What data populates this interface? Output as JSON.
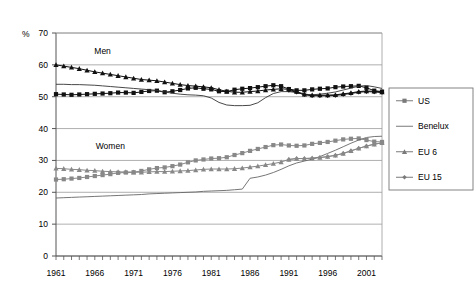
{
  "chart_data": {
    "type": "line",
    "title": "",
    "xlabel": "",
    "ylabel": "%",
    "ylim": [
      0,
      70
    ],
    "xlim": [
      1961,
      2003
    ],
    "ytick_labels": [
      "0",
      "10",
      "20",
      "30",
      "40",
      "50",
      "60",
      "70"
    ],
    "ytick_values": [
      0,
      10,
      20,
      30,
      40,
      50,
      60,
      70
    ],
    "xtick_labels": [
      "1961",
      "1966",
      "1971",
      "1976",
      "1981",
      "1986",
      "1991",
      "1996",
      "2001"
    ],
    "xtick_values": [
      1961,
      1966,
      1971,
      1976,
      1981,
      1986,
      1991,
      1996,
      2001
    ],
    "grid": "horizontal",
    "legend_position": "right",
    "annotations": [
      {
        "text": "Men",
        "x": 1967,
        "y": 63.5
      },
      {
        "text": "Women",
        "x": 1968,
        "y": 33.5
      }
    ],
    "legend": [
      {
        "name": "US",
        "marker": "square",
        "color": "#111111"
      },
      {
        "name": "Benelux",
        "marker": "none",
        "color": "#333333"
      },
      {
        "name": "EU 6",
        "marker": "triangle",
        "color": "#111111"
      },
      {
        "name": "EU 15",
        "marker": "diamond",
        "color": "#111111"
      }
    ],
    "x": [
      1961,
      1962,
      1963,
      1964,
      1965,
      1966,
      1967,
      1968,
      1969,
      1970,
      1971,
      1972,
      1973,
      1974,
      1975,
      1976,
      1977,
      1978,
      1979,
      1980,
      1981,
      1982,
      1983,
      1984,
      1985,
      1986,
      1987,
      1988,
      1989,
      1990,
      1991,
      1992,
      1993,
      1994,
      1995,
      1996,
      1997,
      1998,
      1999,
      2000,
      2001,
      2002,
      2003
    ],
    "series": [
      {
        "name": "Men EU 6",
        "group": "Men",
        "key": "EU 6",
        "marker": "triangle",
        "color": "#111111",
        "values": [
          60.0,
          59.6,
          59.2,
          58.8,
          58.3,
          57.8,
          57.4,
          57.0,
          56.6,
          56.2,
          55.8,
          55.4,
          55.2,
          55.0,
          54.6,
          54.2,
          53.8,
          53.5,
          53.3,
          53.1,
          52.8,
          52.2,
          51.7,
          51.4,
          51.4,
          51.6,
          51.8,
          52.1,
          52.3,
          52.5,
          52.3,
          51.6,
          50.8,
          50.5,
          50.5,
          50.5,
          50.6,
          50.9,
          51.2,
          51.6,
          51.8,
          51.7,
          51.5
        ]
      },
      {
        "name": "Men US",
        "group": "Men",
        "key": "US",
        "marker": "square",
        "color": "#111111",
        "values": [
          50.8,
          50.7,
          50.6,
          50.7,
          50.8,
          50.9,
          51.0,
          51.1,
          51.3,
          51.3,
          51.2,
          51.5,
          51.8,
          51.9,
          51.4,
          51.7,
          52.1,
          52.6,
          52.8,
          52.5,
          52.3,
          51.7,
          51.6,
          52.2,
          52.5,
          52.7,
          53.0,
          53.3,
          53.6,
          53.3,
          52.4,
          52.0,
          52.0,
          52.3,
          52.5,
          52.6,
          53.0,
          53.2,
          53.3,
          53.4,
          52.8,
          51.9,
          51.6
        ]
      },
      {
        "name": "Men Benelux",
        "group": "Men",
        "key": "Benelux",
        "marker": "none",
        "color": "#333333",
        "values": [
          53.9,
          53.9,
          53.8,
          53.8,
          53.7,
          53.6,
          53.4,
          53.2,
          53.0,
          52.8,
          52.6,
          52.4,
          52.2,
          52.0,
          51.5,
          51.1,
          50.8,
          50.6,
          50.5,
          50.3,
          49.6,
          48.2,
          47.4,
          47.2,
          47.2,
          47.3,
          48.1,
          49.7,
          51.0,
          51.6,
          51.6,
          51.3,
          50.8,
          50.6,
          50.8,
          51.1,
          51.5,
          52.1,
          52.7,
          53.3,
          53.5,
          53.1,
          52.6
        ]
      },
      {
        "name": "Men EU 15",
        "group": "Men",
        "key": "EU 15",
        "marker": "diamond",
        "color": "#111111",
        "values": [
          null,
          null,
          null,
          null,
          null,
          null,
          null,
          null,
          null,
          null,
          null,
          null,
          null,
          null,
          null,
          null,
          null,
          null,
          null,
          null,
          null,
          null,
          null,
          null,
          null,
          null,
          null,
          null,
          null,
          null,
          52.0,
          51.4,
          50.6,
          50.3,
          50.3,
          50.3,
          50.4,
          50.7,
          51.0,
          51.4,
          51.6,
          51.5,
          51.3
        ]
      },
      {
        "name": "Women EU 6",
        "group": "Women",
        "key": "EU 6",
        "marker": "triangle",
        "color": "#888888",
        "values": [
          27.5,
          27.4,
          27.2,
          27.1,
          26.9,
          26.8,
          26.6,
          26.5,
          26.4,
          26.4,
          26.3,
          26.3,
          26.4,
          26.5,
          26.5,
          26.6,
          26.7,
          26.8,
          27.0,
          27.2,
          27.3,
          27.3,
          27.3,
          27.4,
          27.6,
          27.9,
          28.2,
          28.6,
          29.0,
          29.5,
          30.3,
          30.6,
          30.6,
          30.7,
          30.9,
          31.2,
          31.6,
          32.2,
          33.0,
          33.8,
          34.5,
          35.1,
          35.5
        ]
      },
      {
        "name": "Women US",
        "group": "Women",
        "key": "US",
        "marker": "square",
        "color": "#888888",
        "values": [
          24.0,
          24.1,
          24.3,
          24.5,
          24.8,
          25.1,
          25.4,
          25.7,
          26.1,
          26.2,
          26.3,
          26.7,
          27.2,
          27.6,
          27.8,
          28.2,
          28.7,
          29.4,
          30.0,
          30.3,
          30.6,
          30.7,
          31.0,
          31.7,
          32.3,
          33.0,
          33.6,
          34.2,
          34.8,
          35.0,
          34.7,
          34.6,
          34.7,
          35.2,
          35.5,
          35.8,
          36.2,
          36.6,
          36.8,
          36.9,
          36.4,
          35.9,
          35.8
        ]
      },
      {
        "name": "Women Benelux",
        "group": "Women",
        "key": "Benelux",
        "marker": "none",
        "color": "#666666",
        "values": [
          18.2,
          18.3,
          18.4,
          18.5,
          18.6,
          18.7,
          18.8,
          18.9,
          19.0,
          19.1,
          19.2,
          19.3,
          19.5,
          19.6,
          19.7,
          19.8,
          19.9,
          20.0,
          20.1,
          20.3,
          20.4,
          20.5,
          20.6,
          20.8,
          21.0,
          24.4,
          24.8,
          25.4,
          26.2,
          27.2,
          28.3,
          29.2,
          29.8,
          30.4,
          31.2,
          32.2,
          33.2,
          34.3,
          35.4,
          36.4,
          37.2,
          37.5,
          37.6
        ]
      },
      {
        "name": "Women EU 15",
        "group": "Women",
        "key": "EU 15",
        "marker": "diamond",
        "color": "#888888",
        "values": [
          null,
          null,
          null,
          null,
          null,
          null,
          null,
          null,
          null,
          null,
          null,
          null,
          null,
          null,
          null,
          null,
          null,
          null,
          null,
          null,
          null,
          null,
          null,
          null,
          null,
          null,
          null,
          null,
          null,
          null,
          30.3,
          30.6,
          30.6,
          30.7,
          30.9,
          31.2,
          31.6,
          32.2,
          33.0,
          33.8,
          34.5,
          35.1,
          35.5
        ]
      }
    ]
  },
  "axis": {
    "unit_symbol": "%"
  }
}
